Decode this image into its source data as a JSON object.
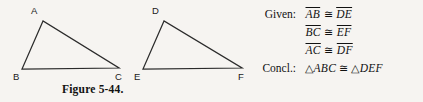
{
  "figure": {
    "caption": "Figure 5-44.",
    "background_color": "#f6f4f1",
    "stroke_color": "#2b2b2b",
    "triangles": [
      {
        "name": "ABC",
        "vertices": [
          {
            "label": "A",
            "x": 43,
            "y": 21,
            "label_x": 31,
            "label_y": 6
          },
          {
            "label": "B",
            "x": 22,
            "y": 69,
            "label_x": 13,
            "label_y": 72
          },
          {
            "label": "C",
            "x": 119,
            "y": 68,
            "label_x": 115,
            "label_y": 72
          }
        ]
      },
      {
        "name": "DEF",
        "vertices": [
          {
            "label": "D",
            "x": 164,
            "y": 21,
            "label_x": 152,
            "label_y": 6
          },
          {
            "label": "E",
            "x": 143,
            "y": 69,
            "label_x": 134,
            "label_y": 72
          },
          {
            "label": "F",
            "x": 242,
            "y": 68,
            "label_x": 238,
            "label_y": 72
          }
        ]
      }
    ]
  },
  "statement": {
    "rows": [
      {
        "key": "Given:",
        "left": "AB",
        "relation": "≅",
        "right": "DE",
        "kind": "segment"
      },
      {
        "key": "",
        "left": "BC",
        "relation": "≅",
        "right": "EF",
        "kind": "segment"
      },
      {
        "key": "",
        "left": "AC",
        "relation": "≅",
        "right": "DF",
        "kind": "segment"
      },
      {
        "key": "Concl.:",
        "left": "ABC",
        "relation": "≅",
        "right": "DEF",
        "kind": "triangle",
        "triangle_symbol": "△"
      }
    ]
  }
}
